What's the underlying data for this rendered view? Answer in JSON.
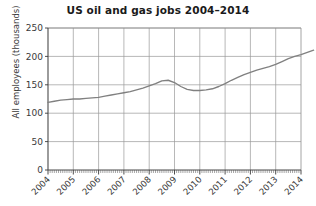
{
  "chart_data": {
    "type": "line",
    "title": "US oil and gas jobs 2004–2014",
    "xlabel": "",
    "ylabel": "All employees (thousands)",
    "ylim": [
      0,
      250
    ],
    "yticks": [
      0,
      50,
      100,
      150,
      200,
      250
    ],
    "ytick_labels": [
      "0",
      "50",
      "100",
      "150",
      "200",
      "250"
    ],
    "xlim": [
      "2004",
      "2014"
    ],
    "xticks": [
      "2004",
      "2005",
      "2006",
      "2007",
      "2008",
      "2009",
      "2010",
      "2011",
      "2012",
      "2013",
      "2014"
    ],
    "xtick_labels": [
      "2004",
      "2005",
      "2006",
      "2007",
      "2008",
      "2009",
      "2010",
      "2011",
      "2012",
      "2013",
      "2014"
    ],
    "minor_ticks": "monthly",
    "grid": true,
    "legend": "none",
    "line_color": "#808080",
    "series": [
      {
        "name": "All employees (thousands)",
        "x": [
          "2004-01",
          "2004-04",
          "2004-07",
          "2004-10",
          "2005-01",
          "2005-04",
          "2005-07",
          "2005-10",
          "2006-01",
          "2006-04",
          "2006-07",
          "2006-10",
          "2007-01",
          "2007-04",
          "2007-07",
          "2007-10",
          "2008-01",
          "2008-04",
          "2008-07",
          "2008-10",
          "2009-01",
          "2009-04",
          "2009-07",
          "2009-10",
          "2010-01",
          "2010-04",
          "2010-07",
          "2010-10",
          "2011-01",
          "2011-04",
          "2011-07",
          "2011-10",
          "2012-01",
          "2012-04",
          "2012-07",
          "2012-10",
          "2013-01",
          "2013-04",
          "2013-07",
          "2013-10",
          "2014-01",
          "2014-04",
          "2014-07"
        ],
        "values": [
          119,
          121,
          123,
          124,
          125,
          125,
          126,
          127,
          128,
          130,
          132,
          134,
          136,
          138,
          141,
          144,
          148,
          152,
          157,
          158,
          154,
          147,
          142,
          140,
          140,
          141,
          143,
          147,
          152,
          158,
          163,
          168,
          172,
          176,
          179,
          182,
          186,
          191,
          196,
          200,
          203,
          207,
          211
        ]
      }
    ]
  }
}
